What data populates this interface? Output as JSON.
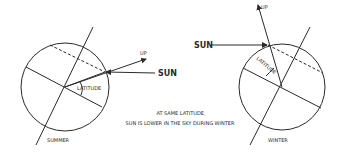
{
  "summer": {
    "title": "SUMMER",
    "sun_label": "SUN",
    "up_label": "UP",
    "latitude_label": "LATITUDE"
  },
  "winter": {
    "title": "WINTER",
    "sun_label": "SUN",
    "up_label": "UP",
    "latitude_label": "LATITUDE"
  },
  "caption": {
    "line1": "AT SAME LATITUDE,",
    "line2": "SUN IS LOWER IN THE SKY DURING WINTER"
  },
  "colors": {
    "line": "#2a2a2a",
    "background": "#ffffff"
  }
}
